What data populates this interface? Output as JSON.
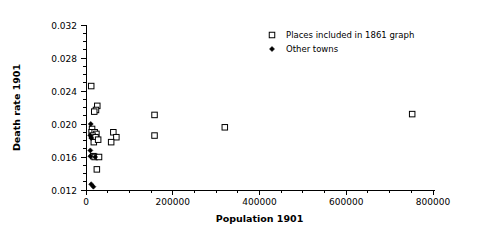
{
  "chart_data": {
    "type": "scatter",
    "title": "",
    "xlabel": "Population 1901",
    "ylabel": "Death rate 1901",
    "xlim": [
      0,
      800000
    ],
    "ylim": [
      0.012,
      0.032
    ],
    "xticks": [
      0,
      200000,
      400000,
      600000,
      800000
    ],
    "xticklabels": [
      "0",
      "200000",
      "400000",
      "600000",
      "800000"
    ],
    "xminor_ticks": [
      50000,
      100000,
      150000,
      250000,
      300000,
      350000,
      450000,
      500000,
      550000,
      650000,
      700000,
      750000
    ],
    "yticks": [
      0.012,
      0.016,
      0.02,
      0.024,
      0.028,
      0.032
    ],
    "yticklabels": [
      "0.012",
      "0.016",
      "0.020",
      "0.024",
      "0.028",
      "0.032"
    ],
    "yminor_ticks": [
      0.013,
      0.014,
      0.015,
      0.017,
      0.018,
      0.019,
      0.021,
      0.022,
      0.023,
      0.025,
      0.026,
      0.027,
      0.029,
      0.03,
      0.031
    ],
    "grid": false,
    "legend_position": "top-right",
    "series": [
      {
        "name": "Places included in 1861 graph",
        "marker": "open-square",
        "points": [
          [
            12000,
            0.0246
          ],
          [
            26000,
            0.0222
          ],
          [
            23000,
            0.0217
          ],
          [
            19000,
            0.0215
          ],
          [
            14000,
            0.0194
          ],
          [
            13000,
            0.019
          ],
          [
            20000,
            0.019
          ],
          [
            24000,
            0.0188
          ],
          [
            15000,
            0.0186
          ],
          [
            22000,
            0.0184
          ],
          [
            18000,
            0.0178
          ],
          [
            28000,
            0.0181
          ],
          [
            63000,
            0.019
          ],
          [
            70000,
            0.0184
          ],
          [
            58000,
            0.0178
          ],
          [
            17000,
            0.0161
          ],
          [
            20000,
            0.016
          ],
          [
            30000,
            0.016
          ],
          [
            25000,
            0.0145
          ],
          [
            158000,
            0.0211
          ],
          [
            158000,
            0.0186
          ],
          [
            320000,
            0.0196
          ],
          [
            752000,
            0.0212
          ]
        ]
      },
      {
        "name": "Other towns",
        "marker": "solid-diamond",
        "points": [
          [
            11000,
            0.02
          ],
          [
            10000,
            0.0186
          ],
          [
            12000,
            0.0183
          ],
          [
            10000,
            0.0168
          ],
          [
            10000,
            0.0161
          ],
          [
            21000,
            0.016
          ],
          [
            12000,
            0.0127
          ],
          [
            17000,
            0.0124
          ]
        ]
      }
    ],
    "legend": [
      {
        "label": "Places included in 1861 graph",
        "marker": "open-square"
      },
      {
        "label": "Other towns",
        "marker": "solid-diamond"
      }
    ]
  }
}
